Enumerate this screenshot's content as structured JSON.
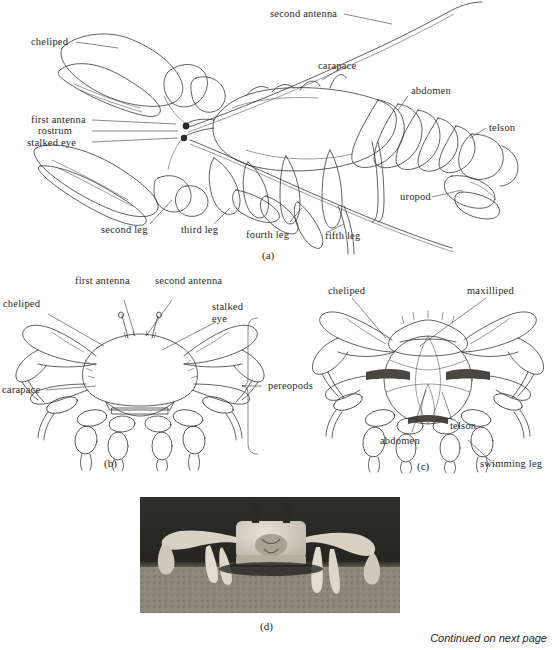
{
  "figure": {
    "footer_note": "Continued on next page",
    "panels": [
      {
        "id": "a",
        "caption": "(a)",
        "subject": "lobster-lateral-view"
      },
      {
        "id": "b",
        "caption": "(b)",
        "subject": "crab-dorsal-view"
      },
      {
        "id": "c",
        "caption": "(c)",
        "subject": "crab-ventral-view"
      },
      {
        "id": "d",
        "caption": "(d)",
        "subject": "ghost-crab-photograph"
      }
    ]
  },
  "panel_a": {
    "caption": "(a)",
    "labels": [
      {
        "key": "second_antenna",
        "text": "second antenna"
      },
      {
        "key": "cheliped",
        "text": "cheliped"
      },
      {
        "key": "carapace",
        "text": "carapace"
      },
      {
        "key": "abdomen",
        "text": "abdomen"
      },
      {
        "key": "first_antenna",
        "text": "first antenna"
      },
      {
        "key": "rostrum",
        "text": "rostrum"
      },
      {
        "key": "stalked_eye",
        "text": "stalked eye"
      },
      {
        "key": "telson",
        "text": "telson"
      },
      {
        "key": "uropod",
        "text": "uropod"
      },
      {
        "key": "second_leg",
        "text": "second leg"
      },
      {
        "key": "third_leg",
        "text": "third leg"
      },
      {
        "key": "fourth_leg",
        "text": "fourth leg"
      },
      {
        "key": "fifth_leg",
        "text": "fifth leg"
      }
    ]
  },
  "panel_b": {
    "caption": "(b)",
    "labels": [
      {
        "key": "first_antenna",
        "text": "first antenna"
      },
      {
        "key": "second_antenna",
        "text": "second antenna"
      },
      {
        "key": "cheliped",
        "text": "cheliped"
      },
      {
        "key": "stalked_eye_line1",
        "text": "stalked"
      },
      {
        "key": "stalked_eye_line2",
        "text": "eye"
      },
      {
        "key": "carapace",
        "text": "carapace"
      },
      {
        "key": "pereopods",
        "text": "pereopods"
      }
    ]
  },
  "panel_c": {
    "caption": "(c)",
    "labels": [
      {
        "key": "cheliped",
        "text": "cheliped"
      },
      {
        "key": "maxilliped",
        "text": "maxilliped"
      },
      {
        "key": "telson",
        "text": "telson"
      },
      {
        "key": "abdomen",
        "text": "abdomen"
      },
      {
        "key": "swimming_leg",
        "text": "swimming leg"
      }
    ]
  },
  "panel_d": {
    "caption": "(d)"
  },
  "colors": {
    "ink": "#2b2b2b",
    "paper": "#ffffff",
    "shade": "#e9e6de",
    "photo_background": "#2a2a28",
    "photo_subject": "#cfc9bd",
    "photo_ground": "#8e8madd"
  }
}
